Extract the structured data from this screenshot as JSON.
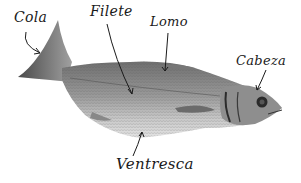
{
  "diagram": {
    "labels": [
      {
        "id": "cola",
        "text": "Cola"
      },
      {
        "id": "filete",
        "text": "Filete"
      },
      {
        "id": "lomo",
        "text": "Lomo"
      },
      {
        "id": "cabeza",
        "text": "Cabeza"
      },
      {
        "id": "ventresca",
        "text": "Ventresca"
      }
    ],
    "colors": {
      "ink": "#1a1a1a",
      "fish_dark": "#3a3a3a",
      "fish_mid": "#8a8a8a",
      "fish_light": "#c8c8c8",
      "background": "#ffffff"
    }
  }
}
